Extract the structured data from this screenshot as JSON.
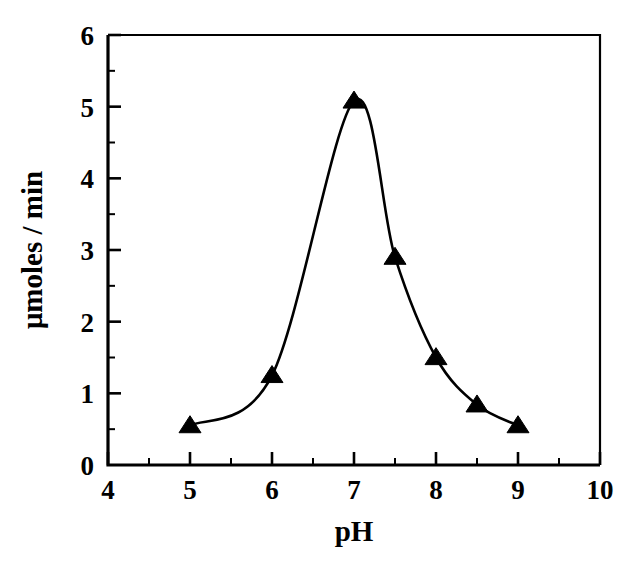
{
  "chart_data": {
    "type": "line",
    "title": "",
    "subtitle": "",
    "xlabel": "pH",
    "ylabel": "μmoles / min",
    "xlim": [
      4,
      10
    ],
    "ylim": [
      0,
      6
    ],
    "grid": false,
    "legend": null,
    "marker": "triangle-up",
    "marker_color": "#000000",
    "line_color": "#000000",
    "x_ticks": [
      4,
      5,
      6,
      7,
      8,
      9,
      10
    ],
    "x_tick_labels": [
      "4",
      "5",
      "6",
      "7",
      "8",
      "9",
      "10"
    ],
    "x_minor_ticks": [
      4.5,
      5.5,
      6.5,
      7.5,
      8.5,
      9.5
    ],
    "y_ticks": [
      0,
      1,
      2,
      3,
      4,
      5,
      6
    ],
    "y_tick_labels": [
      "0",
      "1",
      "2",
      "3",
      "4",
      "5",
      "6"
    ],
    "y_minor_ticks": [
      0.5,
      1.5,
      2.5,
      3.5,
      4.5,
      5.5
    ],
    "series": [
      {
        "name": "activity",
        "x": [
          5.0,
          6.0,
          7.0,
          7.5,
          8.0,
          8.5,
          9.0
        ],
        "values": [
          0.55,
          1.25,
          5.08,
          2.9,
          1.5,
          0.84,
          0.55
        ]
      }
    ],
    "points": [
      {
        "x": 5.0,
        "y": 0.55
      },
      {
        "x": 6.0,
        "y": 1.25
      },
      {
        "x": 7.0,
        "y": 5.08
      },
      {
        "x": 7.5,
        "y": 2.9
      },
      {
        "x": 8.0,
        "y": 1.5
      },
      {
        "x": 8.5,
        "y": 0.84
      },
      {
        "x": 9.0,
        "y": 0.55
      }
    ]
  },
  "axes": {
    "x_title": "pH",
    "y_title": "μmoles / min"
  }
}
